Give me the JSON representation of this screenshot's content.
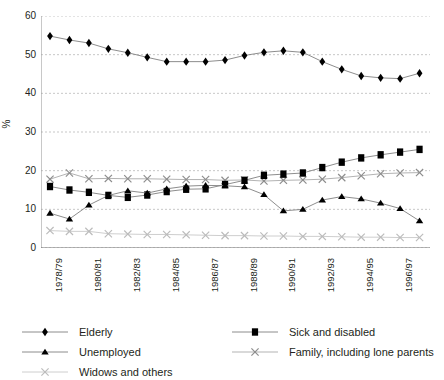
{
  "chart_data": {
    "type": "line",
    "title": "",
    "xlabel": "",
    "ylabel": "%",
    "ylim": [
      0,
      60
    ],
    "ytick_step": 10,
    "yticks": [
      0,
      10,
      20,
      30,
      40,
      50,
      60
    ],
    "grid": "horizontal-dashed",
    "legend_position": "bottom",
    "x": [
      "1978/79",
      "1979/80",
      "1980/81",
      "1981/82",
      "1982/83",
      "1983/84",
      "1984/85",
      "1985/86",
      "1986/87",
      "1987/88",
      "1988/89",
      "1989/90",
      "1990/91",
      "1991/92",
      "1992/93",
      "1993/94",
      "1994/95",
      "1995/96",
      "1996/97",
      "1997/98"
    ],
    "xtick_labels": [
      "1978/79",
      "",
      "1980/81",
      "",
      "1982/83",
      "",
      "1984/85",
      "",
      "1986/87",
      "",
      "1988/89",
      "",
      "1990/91",
      "",
      "1992/93",
      "",
      "1994/95",
      "",
      "1996/97",
      ""
    ],
    "series": [
      {
        "name": "Elderly",
        "marker": "diamond",
        "color": "#000000",
        "line_color": "#808080",
        "values": [
          54.8,
          53.8,
          53.0,
          51.5,
          50.5,
          49.3,
          48.2,
          48.2,
          48.2,
          48.6,
          49.8,
          50.6,
          51.0,
          50.6,
          48.2,
          46.2,
          44.5,
          44.0,
          43.8,
          45.2
        ]
      },
      {
        "name": "Sick and disabled",
        "marker": "square",
        "color": "#000000",
        "line_color": "#808080",
        "values": [
          15.9,
          15.0,
          14.4,
          13.6,
          13.1,
          13.7,
          14.6,
          15.2,
          15.3,
          16.4,
          17.5,
          18.8,
          19.1,
          19.4,
          20.8,
          22.2,
          23.3,
          24.1,
          24.8,
          25.5
        ]
      },
      {
        "name": "Unemployed",
        "marker": "triangle",
        "color": "#000000",
        "line_color": "#808080",
        "values": [
          9.0,
          7.5,
          11.1,
          13.6,
          14.8,
          14.2,
          15.3,
          16.0,
          16.2,
          16.1,
          15.8,
          13.8,
          9.6,
          10.0,
          12.4,
          13.3,
          12.7,
          11.6,
          10.2,
          7.0
        ]
      },
      {
        "name": "Family, including lone parents",
        "marker": "cross",
        "color": "#8c8c8c",
        "line_color": "#aaaaaa",
        "values": [
          17.8,
          19.4,
          17.9,
          18.0,
          17.9,
          17.9,
          17.8,
          17.7,
          17.7,
          17.5,
          17.6,
          17.3,
          17.5,
          17.6,
          17.8,
          18.2,
          18.7,
          19.2,
          19.4,
          19.5
        ]
      },
      {
        "name": "Widows and others",
        "marker": "cross",
        "color": "#bbbbbb",
        "line_color": "#c8c8c8",
        "values": [
          4.5,
          4.3,
          4.3,
          3.7,
          3.6,
          3.5,
          3.5,
          3.4,
          3.3,
          3.2,
          3.2,
          3.1,
          3.1,
          3.0,
          3.0,
          2.9,
          2.8,
          2.8,
          2.7,
          2.7
        ]
      }
    ]
  }
}
